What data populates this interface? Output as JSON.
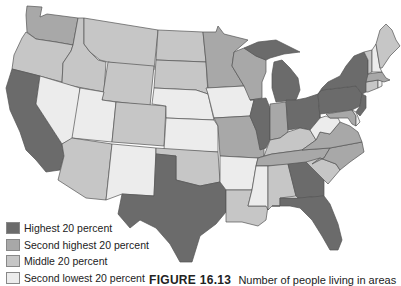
{
  "colors": {
    "highest": "#6b6b6b",
    "second_highest": "#a8a8a8",
    "middle": "#c6c6c6",
    "second_lowest": "#ececec",
    "lowest": "#ffffff",
    "border": "#555555"
  },
  "legend": {
    "items": [
      {
        "label": "Highest 20 percent",
        "color": "#6b6b6b"
      },
      {
        "label": "Second highest 20 percent",
        "color": "#a8a8a8"
      },
      {
        "label": "Middle 20 percent",
        "color": "#c6c6c6"
      },
      {
        "label": "Second lowest 20 percent",
        "color": "#ececec"
      }
    ]
  },
  "caption": {
    "figure_label": "FIGURE 16.13",
    "text": "Number of people living in areas"
  },
  "states": {
    "WA": "second_highest",
    "OR": "middle",
    "CA": "highest",
    "ID": "middle",
    "NV": "second_lowest",
    "MT": "middle",
    "WY": "middle",
    "UT": "second_lowest",
    "AZ": "middle",
    "CO": "middle",
    "NM": "second_lowest",
    "ND": "middle",
    "SD": "middle",
    "NE": "second_lowest",
    "KS": "second_lowest",
    "OK": "middle",
    "TX": "highest",
    "MN": "second_highest",
    "IA": "second_lowest",
    "MO": "second_highest",
    "AR": "second_lowest",
    "LA": "middle",
    "WI": "second_highest",
    "IL": "highest",
    "MI": "highest",
    "IN": "second_highest",
    "OH": "highest",
    "KY": "middle",
    "TN": "second_highest",
    "MS": "second_lowest",
    "AL": "middle",
    "GA": "highest",
    "FL": "highest",
    "SC": "middle",
    "NC": "second_highest",
    "VA": "second_highest",
    "WV": "second_lowest",
    "PA": "highest",
    "NY": "highest",
    "NJ": "highest",
    "MD": "second_highest",
    "DE": "second_lowest",
    "CT": "middle",
    "RI": "second_lowest",
    "MA": "second_highest",
    "VT": "middle",
    "NH": "second_lowest",
    "ME": "middle"
  }
}
